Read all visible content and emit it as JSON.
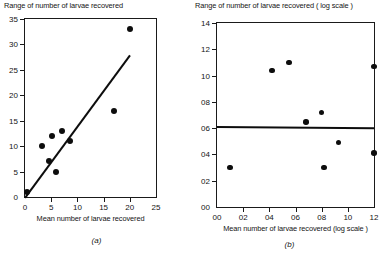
{
  "figure": {
    "background": "#ffffff",
    "ink": "#0d0d0d"
  },
  "chart_data": [
    {
      "type": "scatter",
      "panel": "(a)",
      "title": "",
      "ylabel": "Range of number of larvae recovered",
      "xlabel": "Mean number of larvae recovered",
      "xlim": [
        0,
        25
      ],
      "ylim": [
        0,
        35
      ],
      "xticks": [
        0,
        5,
        10,
        15,
        20,
        25
      ],
      "yticks": [
        0,
        5,
        10,
        15,
        20,
        25,
        30,
        35
      ],
      "xticklabels": [
        "0",
        "5",
        "10",
        "15",
        "20",
        "25"
      ],
      "yticklabels": [
        "0",
        "5",
        "10",
        "15",
        "20",
        "25",
        "30",
        "35"
      ],
      "grid": false,
      "legend": false,
      "x": [
        0.3,
        3.3,
        4.5,
        5.2,
        6.0,
        7.0,
        8.5,
        17.0,
        20.0
      ],
      "y": [
        1.0,
        10.0,
        7.0,
        12.0,
        5.0,
        13.0,
        11.0,
        17.0,
        33.0
      ],
      "fit_line": {
        "label": "regression line",
        "x_start": 0.0,
        "y_start": 0.0,
        "x_end": 20.0,
        "y_end": 28.0
      }
    },
    {
      "type": "scatter",
      "panel": "(b)",
      "title": "",
      "ylabel": "Range of number of larvae recovered ( log scale )",
      "xlabel": "Mean number of larvae recovered (log scale )",
      "xlim": [
        0.0,
        1.2
      ],
      "ylim": [
        0.0,
        1.4
      ],
      "xticks": [
        0.0,
        0.2,
        0.4,
        0.6,
        0.8,
        1.0,
        1.2
      ],
      "yticks": [
        0.0,
        0.2,
        0.4,
        0.6,
        0.8,
        1.0,
        1.2,
        1.4
      ],
      "xticklabels": [
        "00",
        "02",
        "04",
        "06",
        "08",
        "10",
        "12"
      ],
      "yticklabels": [
        "00",
        "02",
        "04",
        "06",
        "08",
        "10",
        "12",
        "14"
      ],
      "grid": false,
      "legend": false,
      "x": [
        0.1,
        0.42,
        0.55,
        0.68,
        0.8,
        0.82,
        0.93,
        1.2,
        1.2
      ],
      "y": [
        0.3,
        1.04,
        1.1,
        0.645,
        0.72,
        0.3,
        0.49,
        1.07,
        0.41
      ],
      "fit_line": {
        "label": "regression line",
        "x_start": 0.0,
        "y_start": 0.618,
        "x_end": 1.2,
        "y_end": 0.608
      }
    }
  ]
}
